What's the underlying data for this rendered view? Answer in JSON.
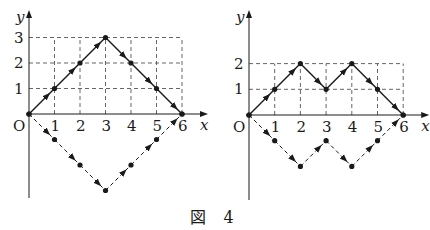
{
  "caption": "図 4",
  "colors": {
    "ink": "#1a1a1a",
    "grid": "#555555"
  },
  "chart_data": [
    {
      "type": "line",
      "title": "left lattice path figure",
      "xlabel": "x",
      "ylabel": "y",
      "origin_label": "O",
      "x_ticks": [
        "1",
        "2",
        "3",
        "4",
        "5",
        "6"
      ],
      "y_ticks": [
        "1",
        "2",
        "3"
      ],
      "grid": "dashed",
      "series": [
        {
          "name": "solid path",
          "style": "solid",
          "points": [
            [
              0,
              0
            ],
            [
              1,
              1
            ],
            [
              2,
              2
            ],
            [
              3,
              3
            ],
            [
              4,
              2
            ],
            [
              5,
              1
            ],
            [
              6,
              0
            ]
          ]
        },
        {
          "name": "dashed reflected path",
          "style": "dashed",
          "points": [
            [
              0,
              0
            ],
            [
              1,
              -1
            ],
            [
              2,
              -2
            ],
            [
              3,
              -3
            ],
            [
              4,
              -2
            ],
            [
              5,
              -1
            ],
            [
              6,
              0
            ]
          ]
        }
      ]
    },
    {
      "type": "line",
      "title": "right lattice path figure",
      "xlabel": "x",
      "ylabel": "y",
      "origin_label": "O",
      "x_ticks": [
        "1",
        "2",
        "3",
        "4",
        "5",
        "6"
      ],
      "y_ticks": [
        "1",
        "2"
      ],
      "grid": "dashed",
      "series": [
        {
          "name": "solid path",
          "style": "solid",
          "points": [
            [
              0,
              0
            ],
            [
              1,
              1
            ],
            [
              2,
              2
            ],
            [
              3,
              1
            ],
            [
              4,
              2
            ],
            [
              5,
              1
            ],
            [
              6,
              0
            ]
          ]
        },
        {
          "name": "dashed reflected path",
          "style": "dashed",
          "points": [
            [
              0,
              0
            ],
            [
              1,
              -1
            ],
            [
              2,
              -2
            ],
            [
              3,
              -1
            ],
            [
              4,
              -2
            ],
            [
              5,
              -1
            ],
            [
              6,
              0
            ]
          ]
        }
      ]
    }
  ]
}
